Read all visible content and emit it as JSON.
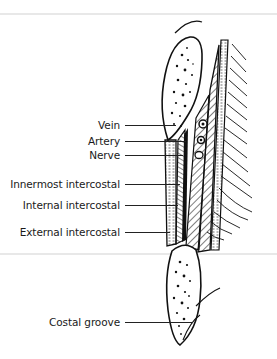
{
  "figure": {
    "type": "anatomical-diagram",
    "labels": [
      {
        "id": "vein",
        "text": "Vein",
        "y": 125,
        "line_end_x": 176
      },
      {
        "id": "artery",
        "text": "Artery",
        "y": 141,
        "line_end_x": 186
      },
      {
        "id": "nerve",
        "text": "Nerve",
        "y": 155,
        "line_end_x": 183
      },
      {
        "id": "innermost-intercostal",
        "text": "Innermost intercostal",
        "y": 184,
        "line_end_x": 180
      },
      {
        "id": "internal-intercostal",
        "text": "Internal intercostal",
        "y": 205,
        "line_end_x": 178
      },
      {
        "id": "external-intercostal",
        "text": "External intercostal",
        "y": 232,
        "line_end_x": 170
      },
      {
        "id": "costal-groove",
        "text": "Costal groove",
        "y": 322,
        "line_end_x": 193
      }
    ],
    "colors": {
      "ink": "#1a1a1a",
      "background": "#ffffff",
      "scan_artifact": "#d8d8d8"
    }
  }
}
